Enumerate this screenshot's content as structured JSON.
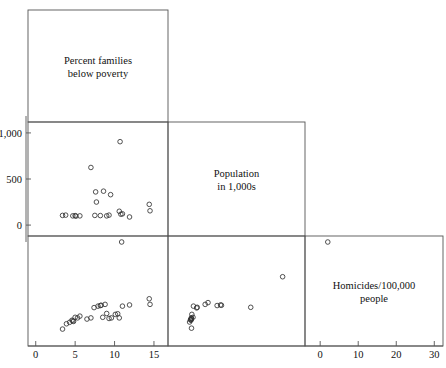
{
  "chart_data": {
    "type": "scatter",
    "title": "",
    "layout": "scatterplot-matrix-lower-triangular",
    "grid": false,
    "legend": null,
    "variables": [
      {
        "key": "poverty",
        "label_line1": "Percent families",
        "label_line2": "below  poverty"
      },
      {
        "key": "population",
        "label_line1": "Population",
        "label_line2": "in 1,000s"
      },
      {
        "key": "homicides",
        "label_line1": "Homicides/100,000",
        "label_line2": "people"
      }
    ],
    "axes": {
      "bottom_left": {
        "for": "poverty",
        "ticks": [
          "0",
          "5",
          "10",
          "15"
        ],
        "values": [
          0,
          5,
          10,
          15
        ],
        "range": [
          -0.6,
          16.4
        ]
      },
      "bottom_right": {
        "for": "homicides",
        "ticks": [
          "0",
          "10",
          "20",
          "30"
        ],
        "values": [
          0,
          10,
          20,
          30
        ],
        "range": [
          -3.2,
          31.5
        ]
      },
      "left": {
        "for": "population",
        "ticks": [
          "1,000",
          "500",
          "0"
        ],
        "values": [
          1000,
          500,
          0
        ],
        "range": [
          -75,
          1075
        ]
      }
    },
    "panels": [
      {
        "name": "poverty-vs-population",
        "row": 2,
        "col": 1,
        "xvar": "poverty",
        "yvar": "population",
        "points": [
          [
            3.4,
            105
          ],
          [
            3.8,
            108
          ],
          [
            4.7,
            100
          ],
          [
            5.0,
            103
          ],
          [
            5.1,
            97
          ],
          [
            5.6,
            100
          ],
          [
            7.0,
            625
          ],
          [
            7.6,
            360
          ],
          [
            7.7,
            250
          ],
          [
            7.5,
            105
          ],
          [
            8.2,
            103
          ],
          [
            8.6,
            368
          ],
          [
            9.0,
            100
          ],
          [
            9.3,
            108
          ],
          [
            9.5,
            330
          ],
          [
            10.7,
            905
          ],
          [
            10.6,
            150
          ],
          [
            10.8,
            118
          ],
          [
            11.0,
            122
          ],
          [
            11.9,
            88
          ],
          [
            14.4,
            225
          ],
          [
            14.5,
            155
          ]
        ]
      },
      {
        "name": "poverty-vs-homicides",
        "row": 3,
        "col": 1,
        "xvar": "poverty",
        "yvar": "homicides",
        "points": [
          [
            3.4,
            1.2
          ],
          [
            3.9,
            3.0
          ],
          [
            4.3,
            3.5
          ],
          [
            4.6,
            4.2
          ],
          [
            4.7,
            4.0
          ],
          [
            4.8,
            3.8
          ],
          [
            5.0,
            5.2
          ],
          [
            5.3,
            5.0
          ],
          [
            5.6,
            5.6
          ],
          [
            6.5,
            4.6
          ],
          [
            7.0,
            5.0
          ],
          [
            7.4,
            8.5
          ],
          [
            7.9,
            9.0
          ],
          [
            8.2,
            9.2
          ],
          [
            8.3,
            9.3
          ],
          [
            8.5,
            5.2
          ],
          [
            8.8,
            9.6
          ],
          [
            9.0,
            6.5
          ],
          [
            9.3,
            4.8
          ],
          [
            9.6,
            5.0
          ],
          [
            10.1,
            6.2
          ],
          [
            10.4,
            6.4
          ],
          [
            10.6,
            5.0
          ],
          [
            11.0,
            9.0
          ],
          [
            11.9,
            9.4
          ],
          [
            14.4,
            11.5
          ],
          [
            14.5,
            9.6
          ]
        ]
      },
      {
        "name": "population-vs-homicides",
        "row": 3,
        "col": 2,
        "xvar": "population",
        "yvar": "homicides",
        "points": [
          [
            88,
            3.6
          ],
          [
            97,
            4.4
          ],
          [
            100,
            4.2
          ],
          [
            100,
            4.4
          ],
          [
            103,
            4.6
          ],
          [
            103,
            5.0
          ],
          [
            105,
            4.8
          ],
          [
            105,
            1.5
          ],
          [
            108,
            6.2
          ],
          [
            118,
            5.2
          ],
          [
            122,
            9.0
          ],
          [
            150,
            8.4
          ],
          [
            155,
            8.6
          ],
          [
            225,
            9.6
          ],
          [
            250,
            10.2
          ],
          [
            330,
            9.2
          ],
          [
            360,
            9.4
          ],
          [
            368,
            9.3
          ],
          [
            625,
            8.6
          ],
          [
            905,
            19.0
          ]
        ]
      }
    ],
    "off_axis_points": [
      {
        "name": "poverty-low-outlier",
        "panel": "poverty-vs-homicides-upper-gap",
        "x": 10.9,
        "y_note": "just below population zero line"
      },
      {
        "name": "population-outlier",
        "panel": "population-vs-homicides-upper-gap",
        "x_note": "near 2.0 on homicides scale"
      }
    ]
  }
}
